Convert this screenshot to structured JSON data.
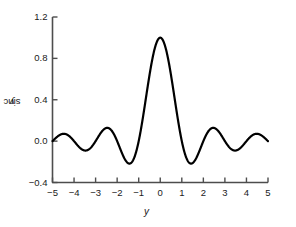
{
  "chart_data": {
    "type": "line",
    "title": "",
    "xlabel": "y",
    "ylabel": "sinc y",
    "xlim": [
      -5,
      5
    ],
    "ylim": [
      -0.4,
      1.2
    ],
    "grid": false,
    "legend": null,
    "x_ticks": [
      -5,
      -4,
      -3,
      -2,
      -1,
      0,
      1,
      2,
      3,
      4,
      5
    ],
    "x_tick_labels": [
      "−5",
      "−4",
      "−3",
      "−2",
      "−1",
      "0",
      "1",
      "2",
      "3",
      "4",
      "5"
    ],
    "y_ticks": [
      -0.4,
      0.0,
      0.4,
      0.8,
      1.2
    ],
    "y_tick_labels": [
      "−0.4",
      "0.0",
      "0.4",
      "0.8",
      "1.2"
    ],
    "series": [
      {
        "name": "sinc y",
        "function": "sin(pi*y)/(pi*y)",
        "color": "#000000",
        "linewidth": 2.2,
        "x": [
          -5.0,
          -4.9,
          -4.8,
          -4.7,
          -4.6,
          -4.5,
          -4.4,
          -4.3,
          -4.2,
          -4.1,
          -4.0,
          -3.9,
          -3.8,
          -3.7,
          -3.6,
          -3.5,
          -3.4,
          -3.3,
          -3.2,
          -3.1,
          -3.0,
          -2.9,
          -2.8,
          -2.7,
          -2.6,
          -2.5,
          -2.4,
          -2.3,
          -2.2,
          -2.1,
          -2.0,
          -1.9,
          -1.8,
          -1.7,
          -1.6,
          -1.5,
          -1.4,
          -1.3,
          -1.2,
          -1.1,
          -1.0,
          -0.9,
          -0.8,
          -0.7,
          -0.6,
          -0.5,
          -0.4,
          -0.3,
          -0.2,
          -0.1,
          0.0,
          0.1,
          0.2,
          0.3,
          0.4,
          0.5,
          0.6,
          0.7,
          0.8,
          0.9,
          1.0,
          1.1,
          1.2,
          1.3,
          1.4,
          1.5,
          1.6,
          1.7,
          1.8,
          1.9,
          2.0,
          2.1,
          2.2,
          2.3,
          2.4,
          2.5,
          2.6,
          2.7,
          2.8,
          2.9,
          3.0,
          3.1,
          3.2,
          3.3,
          3.4,
          3.5,
          3.6,
          3.7,
          3.8,
          3.9,
          4.0,
          4.1,
          4.2,
          4.3,
          4.4,
          4.5,
          4.6,
          4.7,
          4.8,
          4.9,
          5.0
        ],
        "y": [
          0.0,
          0.02,
          0.039,
          0.056,
          0.068,
          0.071,
          0.067,
          0.054,
          0.037,
          0.018,
          0.0,
          -0.016,
          -0.026,
          -0.031,
          -0.031,
          -0.028,
          -0.022,
          -0.015,
          -0.008,
          -0.002,
          0.0,
          0.004,
          0.017,
          0.037,
          0.06,
          0.085,
          0.104,
          0.115,
          0.116,
          0.106,
          0.0,
          -0.033,
          -0.065,
          -0.092,
          -0.113,
          -0.127,
          -0.132,
          -0.127,
          -0.112,
          -0.089,
          0.0,
          0.109,
          0.234,
          0.368,
          0.505,
          0.637,
          0.757,
          0.858,
          0.935,
          0.984,
          1.0,
          0.984,
          0.935,
          0.858,
          0.757,
          0.637,
          0.505,
          0.368,
          0.234,
          0.109,
          0.0,
          -0.089,
          -0.112,
          -0.127,
          -0.132,
          -0.127,
          -0.113,
          -0.092,
          -0.065,
          -0.033,
          0.0,
          0.106,
          0.116,
          0.115,
          0.104,
          0.085,
          0.06,
          0.037,
          0.017,
          0.004,
          0.0,
          -0.002,
          -0.008,
          -0.015,
          -0.022,
          -0.028,
          -0.031,
          -0.031,
          -0.026,
          -0.016,
          0.0,
          0.018,
          0.037,
          0.054,
          0.067,
          0.071,
          0.068,
          0.056,
          0.039,
          0.02,
          0.0
        ]
      }
    ]
  },
  "axes": {
    "y_title_prefix": "sinc ",
    "y_title_variable": "y",
    "x_title": "y"
  },
  "colors": {
    "curve": "#000000",
    "axis": "#4d4d4d",
    "text": "#1a1a1a",
    "background": "#ffffff"
  }
}
